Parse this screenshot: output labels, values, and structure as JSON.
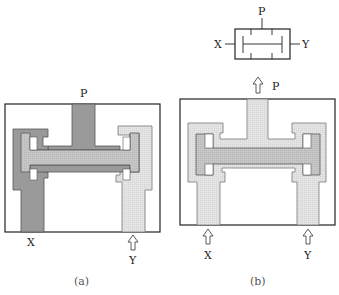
{
  "figure": {
    "panels": [
      {
        "id": "a",
        "caption": "(a)",
        "labels": {
          "top": "P",
          "bottom_left": "X",
          "bottom_right": "Y"
        },
        "description": "Valve section with pressure P applied and port X pressurized (dark), Y inlet (light); spool shifted"
      },
      {
        "id": "b",
        "caption": "(b)",
        "labels": {
          "top": "P",
          "bottom_left": "X",
          "bottom_right": "Y"
        },
        "description": "Valve section with both X and Y inlets, spool centered"
      }
    ],
    "symbol": {
      "labels": {
        "top": "P",
        "left": "X",
        "right": "Y"
      }
    }
  },
  "colors": {
    "dark_fill": "#9a9a9a",
    "mid_fill": "#c4c4c4",
    "light_fill": "#e6e6e6",
    "stroke": "#222222"
  }
}
